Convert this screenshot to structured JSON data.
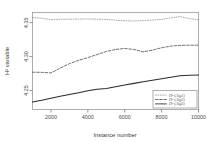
{
  "chart_data": {
    "type": "line",
    "title": "",
    "xlabel": "Instance number",
    "ylabel": "H² variable",
    "xlim": [
      1000,
      10000
    ],
    "ylim": [
      4.222,
      4.365
    ],
    "grid": false,
    "legend_position": "bottom-right",
    "xticks": [
      2000,
      4000,
      6000,
      8000,
      10000
    ],
    "xtick_labels": [
      "2000",
      "4000",
      "6000",
      "8000",
      "10000"
    ],
    "yticks": [
      4.25,
      4.3,
      4.35
    ],
    "ytick_labels": [
      "4.25",
      "4.30",
      "4.35"
    ],
    "x": [
      1000,
      1500,
      2000,
      2500,
      3000,
      3500,
      4000,
      4500,
      5000,
      5500,
      6000,
      6500,
      7000,
      7500,
      8000,
      8500,
      9000,
      9500,
      10000
    ],
    "series": [
      {
        "name": "H² (Alg1)",
        "linestyle": "dotted",
        "color": "#9b9b9b",
        "values": [
          4.3575,
          4.3565,
          4.3545,
          4.355,
          4.3552,
          4.3553,
          4.3554,
          4.3552,
          4.3548,
          4.3538,
          4.3528,
          4.3525,
          4.353,
          4.3538,
          4.3548,
          4.357,
          4.359,
          4.356,
          4.3545
        ]
      },
      {
        "name": "H² (Alg2)",
        "linestyle": "dashed",
        "color": "#5a5a5a",
        "values": [
          4.277,
          4.2768,
          4.276,
          4.283,
          4.2895,
          4.2945,
          4.2985,
          4.303,
          4.3075,
          4.3105,
          4.312,
          4.3105,
          4.307,
          4.3095,
          4.313,
          4.3155,
          4.3165,
          4.3168,
          4.3168
        ]
      },
      {
        "name": "H² (Alg3)",
        "linestyle": "solid",
        "color": "#2a2a2a",
        "values": [
          4.233,
          4.2355,
          4.2385,
          4.2415,
          4.2442,
          4.2468,
          4.2495,
          4.252,
          4.253,
          4.2555,
          4.258,
          4.2605,
          4.2628,
          4.265,
          4.2672,
          4.2695,
          4.2718,
          4.2725,
          4.2728
        ]
      }
    ]
  }
}
